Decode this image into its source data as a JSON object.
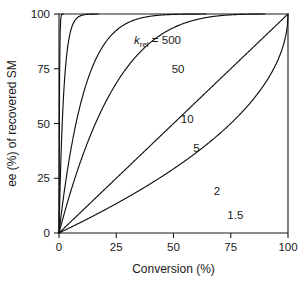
{
  "chart_data": {
    "type": "line",
    "title": "",
    "xlabel": "Conversion (%)",
    "ylabel": "ee (%) of recovered SM",
    "xlim": [
      0,
      100
    ],
    "ylim": [
      0,
      100
    ],
    "xticks": [
      0,
      25,
      50,
      75,
      100
    ],
    "yticks": [
      0,
      25,
      50,
      75,
      100
    ],
    "xtick_labels": [
      "0",
      "25",
      "50",
      "75",
      "100"
    ],
    "ytick_labels": [
      "0",
      "25",
      "50",
      "75",
      "100"
    ],
    "grid": false,
    "legend_position": "inline-curve-labels",
    "annotation_prefix": "k",
    "annotation_subscript": "rel",
    "annotation_equals": "= 500",
    "equation": "ee_SM = 1 - (1 - c)^(k_rel - 1)",
    "series": [
      {
        "name": "500",
        "krel": 500,
        "label": "k_rel = 500",
        "label_text": "500",
        "x": [
          0,
          5,
          10,
          15,
          20,
          25,
          30,
          35,
          40,
          45,
          50,
          52
        ],
        "values": [
          0,
          22.6,
          41.0,
          55.8,
          67.6,
          76.9,
          84.0,
          89.3,
          93.2,
          95.9,
          97.7,
          98.2
        ]
      },
      {
        "name": "50",
        "krel": 50,
        "label_text": "50",
        "x": [
          0,
          5,
          10,
          15,
          20,
          25,
          30,
          35,
          40,
          45,
          50,
          55,
          58
        ],
        "values": [
          0,
          20.6,
          37.6,
          51.7,
          63.2,
          72.6,
          80.2,
          86.1,
          90.7,
          94.2,
          96.6,
          98.3,
          99.0
        ]
      },
      {
        "name": "10",
        "krel": 10,
        "label_text": "10",
        "x": [
          0,
          10,
          20,
          30,
          40,
          50,
          60,
          65,
          70,
          72
        ],
        "values": [
          0,
          22.6,
          40.7,
          57.8,
          72.3,
          83.6,
          91.6,
          94.3,
          96.4,
          97.1
        ]
      },
      {
        "name": "5",
        "krel": 5,
        "label_text": "5",
        "x": [
          0,
          10,
          20,
          30,
          40,
          50,
          60,
          70,
          80,
          85,
          88
        ],
        "values": [
          0,
          13.0,
          26.0,
          38.4,
          50.0,
          60.4,
          69.6,
          77.6,
          84.6,
          87.7,
          89.4
        ]
      },
      {
        "name": "2",
        "krel": 2,
        "label_text": "2",
        "x": [
          0,
          10,
          20,
          30,
          40,
          50,
          60,
          70,
          80,
          90,
          95,
          100
        ],
        "values": [
          0,
          10,
          20,
          30,
          40,
          50,
          60,
          70,
          80,
          90,
          95,
          100
        ]
      },
      {
        "name": "1.5",
        "krel": 1.5,
        "label_text": "1.5",
        "x": [
          0,
          10,
          20,
          30,
          40,
          50,
          60,
          70,
          80,
          90,
          95,
          100
        ],
        "values": [
          0,
          5.1,
          10.6,
          16.3,
          22.5,
          29.3,
          36.8,
          45.2,
          55.3,
          68.4,
          77.6,
          100
        ]
      }
    ],
    "curve_labels": [
      {
        "text": "500",
        "x": 43,
        "y": 88
      },
      {
        "text": "50",
        "x": 52,
        "y": 75
      },
      {
        "text": "10",
        "x": 56,
        "y": 52
      },
      {
        "text": "5",
        "x": 60,
        "y": 39
      },
      {
        "text": "2",
        "x": 69,
        "y": 19
      },
      {
        "text": "1.5",
        "x": 77,
        "y": 8
      }
    ]
  }
}
